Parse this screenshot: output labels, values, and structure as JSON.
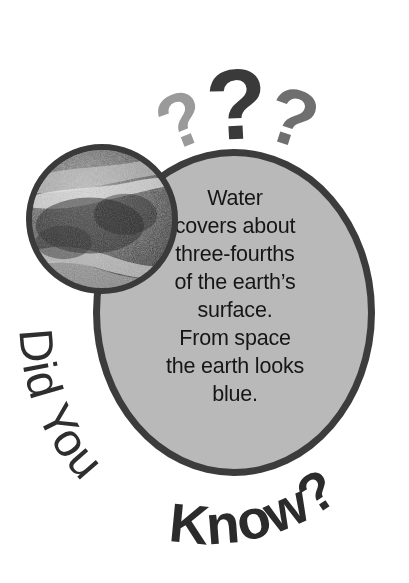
{
  "poster": {
    "title_part_light": "Did You ",
    "title_part_bold": "Know?",
    "title_full": "Did You Know?",
    "fact_text": "Water\ncovers about\nthree-fourths\nof the earth’s\nsurface.\nFrom space\nthe earth looks\nblue.",
    "fact_lines": [
      "Water",
      "covers about",
      "three-fourths",
      "of the earth’s",
      "surface.",
      "From space",
      "the earth looks",
      "blue."
    ],
    "question_marks": [
      {
        "glyph": "?",
        "shade": "#9a9a9a",
        "name": "question-mark-left"
      },
      {
        "glyph": "?",
        "shade": "#3a3a3a",
        "name": "question-mark-center"
      },
      {
        "glyph": "?",
        "shade": "#6f6f6f",
        "name": "question-mark-right"
      }
    ],
    "photo_alt": "earth-from-space-grayscale",
    "colors": {
      "bubble_fill": "#b9b9b9",
      "bubble_stroke": "#3c3c3c",
      "text": "#161616",
      "headline": "#2b2b2b",
      "background": "#ffffff"
    }
  }
}
